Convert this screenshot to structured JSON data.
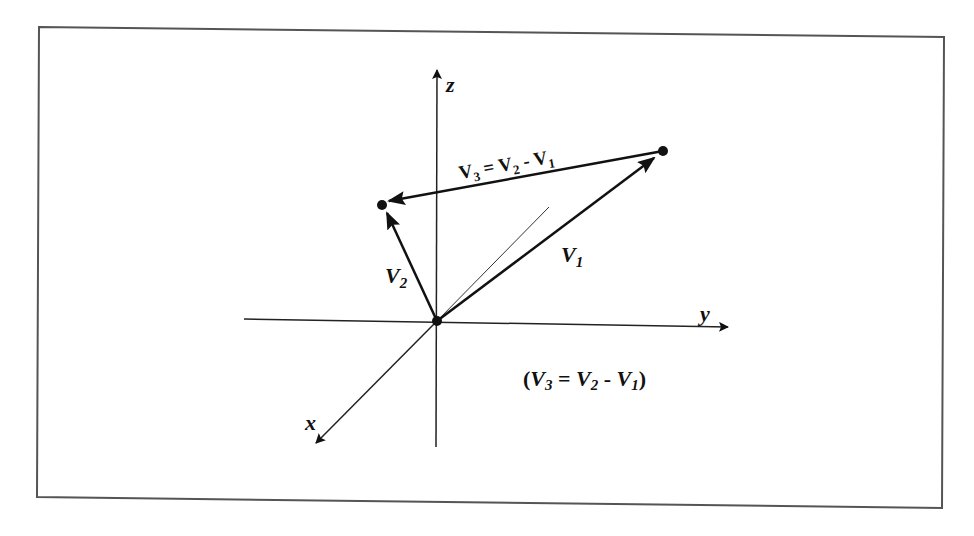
{
  "figure": {
    "type": "3d-vector-subtraction-diagram",
    "axes": {
      "x_label": "x",
      "y_label": "y",
      "z_label": "z"
    },
    "vectors": [
      {
        "id": "V1",
        "label_main": "V",
        "label_sub": "1",
        "from": "origin",
        "to": "point-right"
      },
      {
        "id": "V2",
        "label_main": "V",
        "label_sub": "2",
        "from": "origin",
        "to": "point-left"
      },
      {
        "id": "V3",
        "label_main": "V",
        "label_sub": "3",
        "from": "point-right",
        "to": "point-left"
      }
    ],
    "top_equation": {
      "v3": "V",
      "v3_sub": "3",
      "eq": " = ",
      "v2": "V",
      "v2_sub": "2",
      "minus": " - ",
      "v1": "V",
      "v1_sub": "1"
    },
    "caption_equation": {
      "open": "(",
      "v3": "V",
      "v3_sub": "3",
      "eq": " = ",
      "v2": "V",
      "v2_sub": "2",
      "minus": " - ",
      "v1": "V",
      "v1_sub": "1",
      "close": ")"
    },
    "colors": {
      "ink": "#111111",
      "frame": "#555555",
      "background": "#ffffff"
    }
  }
}
